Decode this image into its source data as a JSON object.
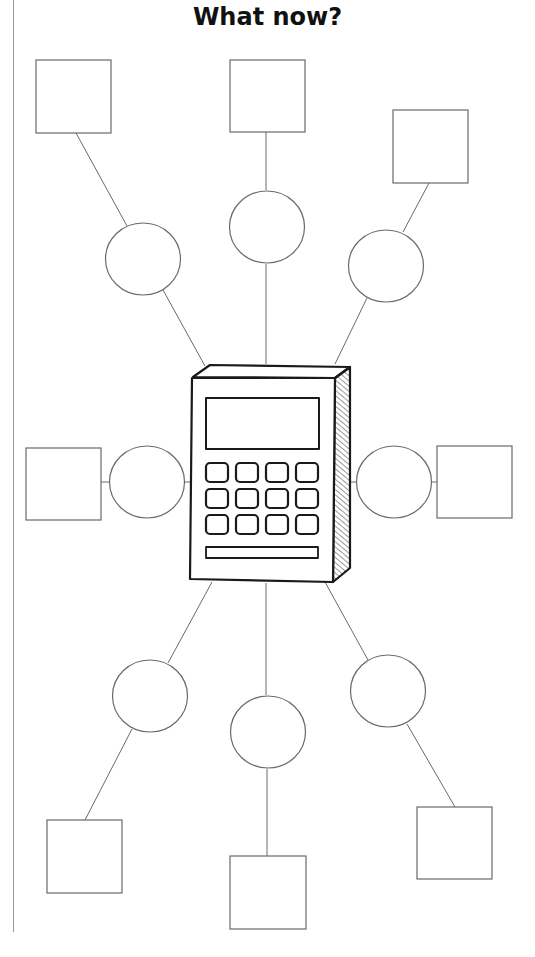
{
  "title": "What now?",
  "colors": {
    "stroke": "#6a6a6a",
    "calc_stroke": "#1a1a1a",
    "background": "#ffffff",
    "margin_line": "#9a9a9a"
  },
  "diagram": {
    "center": {
      "type": "calculator-illustration",
      "label": "calculator"
    },
    "branches": [
      {
        "id": "top-left",
        "circle": {
          "cx": 143,
          "cy": 259,
          "r": 37
        },
        "box": {
          "x": 36,
          "y": 60,
          "w": 75,
          "h": 73
        }
      },
      {
        "id": "top-center",
        "circle": {
          "cx": 267,
          "cy": 227,
          "r": 37
        },
        "box": {
          "x": 230,
          "y": 60,
          "w": 75,
          "h": 72
        }
      },
      {
        "id": "top-right",
        "circle": {
          "cx": 386,
          "cy": 266,
          "r": 37
        },
        "box": {
          "x": 393,
          "y": 110,
          "w": 75,
          "h": 73
        }
      },
      {
        "id": "middle-left",
        "circle": {
          "cx": 147,
          "cy": 482,
          "r": 37
        },
        "box": {
          "x": 26,
          "y": 448,
          "w": 75,
          "h": 72
        }
      },
      {
        "id": "middle-right",
        "circle": {
          "cx": 394,
          "cy": 482,
          "r": 37
        },
        "box": {
          "x": 437,
          "y": 446,
          "w": 75,
          "h": 72
        }
      },
      {
        "id": "bottom-left",
        "circle": {
          "cx": 150,
          "cy": 696,
          "r": 37
        },
        "box": {
          "x": 47,
          "y": 820,
          "w": 75,
          "h": 73
        }
      },
      {
        "id": "bottom-center",
        "circle": {
          "cx": 268,
          "cy": 732,
          "r": 37
        },
        "box": {
          "x": 230,
          "y": 856,
          "w": 76,
          "h": 73
        }
      },
      {
        "id": "bottom-right",
        "circle": {
          "cx": 388,
          "cy": 691,
          "r": 37
        },
        "box": {
          "x": 417,
          "y": 807,
          "w": 75,
          "h": 72
        }
      }
    ],
    "box_text": [
      "",
      "",
      "",
      "",
      "",
      "",
      "",
      ""
    ],
    "circle_text": [
      "",
      "",
      "",
      "",
      "",
      "",
      "",
      ""
    ]
  }
}
